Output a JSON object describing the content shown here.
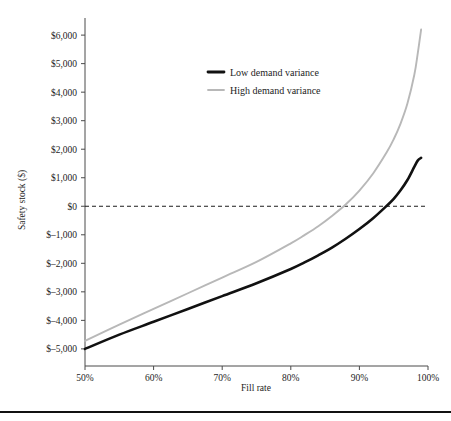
{
  "chart_data": {
    "type": "line",
    "title": "",
    "xlabel": "Fill rate",
    "ylabel": "Safety stock ($)",
    "xlim": [
      50,
      100
    ],
    "ylim": [
      -5600,
      6600
    ],
    "grid": false,
    "legend_position": "top-center",
    "xticks": [
      "50%",
      "60%",
      "70%",
      "80%",
      "90%",
      "100%"
    ],
    "xtick_values": [
      50,
      60,
      70,
      80,
      90,
      100
    ],
    "yticks": [
      "$6,000",
      "$5,000",
      "$4,000",
      "$3,000",
      "$2,000",
      "$1,000",
      "$0",
      "$–1,000",
      "$–2,000",
      "$–3,000",
      "$–4,000",
      "$–5,000"
    ],
    "ytick_values": [
      6000,
      5000,
      4000,
      3000,
      2000,
      1000,
      0,
      -1000,
      -2000,
      -3000,
      -4000,
      -5000
    ],
    "reference_lines": [
      {
        "name": "zero-reference",
        "axis": "y",
        "value": 0,
        "style": "dashed"
      }
    ],
    "x": [
      50,
      55,
      60,
      65,
      70,
      75,
      80,
      82,
      84,
      86,
      88,
      90,
      92,
      94,
      95,
      96,
      97,
      98,
      98.5,
      99
    ],
    "series": [
      {
        "name": "Low demand variance",
        "color": "#111111",
        "width": 2.6,
        "values": [
          -5000,
          -4500,
          -4050,
          -3600,
          -3150,
          -2700,
          -2200,
          -1970,
          -1720,
          -1450,
          -1140,
          -800,
          -420,
          20,
          260,
          560,
          920,
          1380,
          1600,
          1700
        ]
      },
      {
        "name": "High demand variance",
        "color": "#b8b8b8",
        "width": 1.9,
        "values": [
          -4720,
          -4150,
          -3600,
          -3050,
          -2500,
          -1950,
          -1300,
          -1010,
          -700,
          -340,
          60,
          550,
          1150,
          1900,
          2350,
          2900,
          3600,
          4600,
          5350,
          6200
        ]
      }
    ],
    "legend": [
      {
        "label": "Low demand variance",
        "color": "#111111",
        "width": 2.8
      },
      {
        "label": "High demand variance",
        "color": "#b8b8b8",
        "width": 1.8
      }
    ]
  },
  "figure": {
    "page_rule_color": "#111111"
  }
}
